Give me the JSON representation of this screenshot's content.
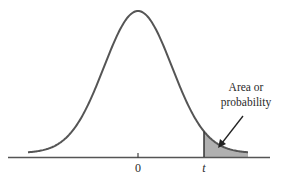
{
  "diagram": {
    "type": "t-distribution right-tail area",
    "axis": {
      "ticks": [
        {
          "label": "0",
          "italic": false
        },
        {
          "label": "t",
          "italic": true
        }
      ]
    },
    "annotation": {
      "line1": "Area or",
      "line2": "probability"
    },
    "colors": {
      "curve": "#555555",
      "axis": "#555555",
      "shade": "#b0b0b0",
      "text": "#2a2a2a"
    }
  }
}
